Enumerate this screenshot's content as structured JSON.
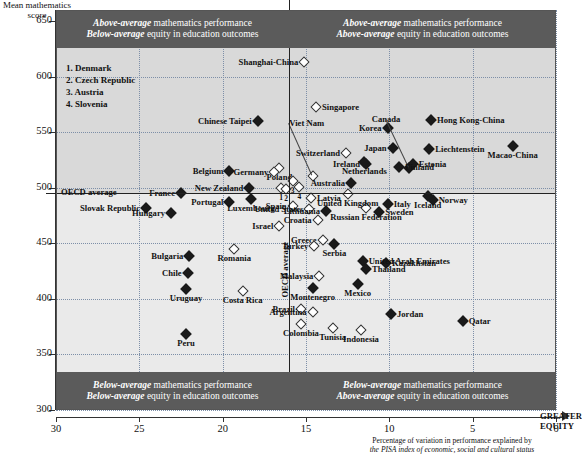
{
  "axes": {
    "y_title": "Mean mathematics score",
    "y_ticks": [
      650,
      600,
      550,
      500,
      450,
      400,
      350,
      300
    ],
    "x_ticks": [
      30,
      25,
      20,
      15,
      10,
      5,
      0
    ],
    "x_title_line1": "Percentage of variation in performance explained by",
    "x_title_line2_italic": "the PISA index of economic, social and cultural status",
    "greater_equity_line1": "GREATER",
    "greater_equity_line2": "EQUITY",
    "oecd_h_label": "OECD average",
    "oecd_v_label": "OECD average"
  },
  "quadrants": [
    {
      "id": "top-left",
      "line1_bold": "Above-average",
      "line1_rest": " mathematics performance",
      "line2_bold": "Below-average",
      "line2_rest": " equity in education outcomes"
    },
    {
      "id": "top-right",
      "line1_bold": "Above-average",
      "line1_rest": " mathematics performance",
      "line2_bold": "Above-average",
      "line2_rest": " equity in education outcomes"
    },
    {
      "id": "bottom-left",
      "line1_bold": "Below-average",
      "line1_rest": " mathematics performance",
      "line2_bold": "Below-average",
      "line2_rest": " equity in education outcomes"
    },
    {
      "id": "bottom-right",
      "line1_bold": "Below-average",
      "line1_rest": " mathematics performance",
      "line2_bold": "Above-average",
      "line2_rest": " equity in education outcomes"
    }
  ],
  "legend": {
    "items": [
      "1. Denmark",
      "2. Czech Republic",
      "3. Austria",
      "4. Slovenia"
    ]
  },
  "colors": {
    "quadrant_upper": "#d9d9d9",
    "quadrant_lower": "#eaeaea",
    "banner": "#5b5b5b",
    "banner_text": "#ffffff",
    "gridline": "#7d8fa8",
    "marker_filled": "#1a1a1a",
    "marker_open": "#ffffff"
  },
  "chart_data": {
    "type": "scatter",
    "title": "",
    "xlabel": "Percentage of variation in performance explained by the PISA index of economic, social and cultural status",
    "ylabel": "Mean mathematics score",
    "xlim": [
      30,
      0
    ],
    "x_reversed": true,
    "ylim": [
      300,
      660
    ],
    "grid": true,
    "oecd_average_x": 14.8,
    "oecd_average_y": 496,
    "marker_legend": {
      "filled": "OECD member / statistically significant",
      "open": "non-significant"
    },
    "points": [
      {
        "name": "Shanghai-China",
        "x": 15.1,
        "y": 613,
        "marker": "open",
        "label_pos": "r"
      },
      {
        "name": "Singapore",
        "x": 14.4,
        "y": 573,
        "marker": "open",
        "label_pos": "l"
      },
      {
        "name": "Chinese Taipei",
        "x": 17.9,
        "y": 560,
        "marker": "filled",
        "label_pos": "r"
      },
      {
        "name": "Viet Nam",
        "x": 14.6,
        "y": 511,
        "marker": "open",
        "label_pos": "l",
        "leader": true,
        "label_x": 16.0,
        "label_y": 558
      },
      {
        "name": "Korea",
        "x": 10.1,
        "y": 554,
        "marker": "filled",
        "label_pos": "r"
      },
      {
        "name": "Canada",
        "x": 8.8,
        "y": 518,
        "marker": "filled",
        "label_pos": "c",
        "leader": true,
        "label_x": 10.2,
        "label_y": 562
      },
      {
        "name": "Hong Kong-China",
        "x": 7.5,
        "y": 561,
        "marker": "filled",
        "label_pos": "l"
      },
      {
        "name": "Japan",
        "x": 9.8,
        "y": 536,
        "marker": "filled",
        "label_pos": "r"
      },
      {
        "name": "Switzerland",
        "x": 12.6,
        "y": 531,
        "marker": "open",
        "label_pos": "r"
      },
      {
        "name": "Liechtenstein",
        "x": 7.6,
        "y": 535,
        "marker": "filled",
        "label_pos": "l"
      },
      {
        "name": "Macao-China",
        "x": 2.6,
        "y": 538,
        "marker": "filled",
        "label_pos": "c"
      },
      {
        "name": "Ireland",
        "x": 11.4,
        "y": 521,
        "marker": "filled",
        "label_pos": "r"
      },
      {
        "name": "Estonia",
        "x": 8.6,
        "y": 521,
        "marker": "filled",
        "label_pos": "l"
      },
      {
        "name": "Netherlands",
        "x": 11.5,
        "y": 523,
        "marker": "filled",
        "label_pos": "c"
      },
      {
        "name": "Australia",
        "x": 12.3,
        "y": 504,
        "marker": "filled",
        "label_pos": "r"
      },
      {
        "name": "Finland",
        "x": 9.4,
        "y": 519,
        "marker": "filled",
        "label_pos": "l",
        "leader": true
      },
      {
        "name": "Poland",
        "x": 16.6,
        "y": 518,
        "marker": "open",
        "label_pos": "c"
      },
      {
        "name": "Belgium",
        "x": 19.6,
        "y": 515,
        "marker": "filled",
        "label_pos": "r"
      },
      {
        "name": "Germany",
        "x": 16.9,
        "y": 514,
        "marker": "open",
        "label_pos": "r"
      },
      {
        "name": "Denmark",
        "x": 16.5,
        "y": 500,
        "marker": "open",
        "number": 1
      },
      {
        "name": "Czech Republic",
        "x": 16.2,
        "y": 499,
        "marker": "open",
        "number": 2
      },
      {
        "name": "Austria",
        "x": 15.8,
        "y": 506,
        "marker": "open",
        "number": 3
      },
      {
        "name": "Slovenia",
        "x": 15.4,
        "y": 501,
        "marker": "open",
        "number": 4
      },
      {
        "name": "New Zealand",
        "x": 18.4,
        "y": 500,
        "marker": "filled",
        "label_pos": "r"
      },
      {
        "name": "France",
        "x": 22.5,
        "y": 495,
        "marker": "filled",
        "label_pos": "r"
      },
      {
        "name": "OECD average",
        "x": 14.8,
        "y": 494,
        "marker": "none"
      },
      {
        "name": "Portugal",
        "x": 19.6,
        "y": 487,
        "marker": "filled",
        "label_pos": "r"
      },
      {
        "name": "Spain",
        "x": 15.8,
        "y": 484,
        "marker": "open",
        "label_pos": "r"
      },
      {
        "name": "Latvia",
        "x": 14.7,
        "y": 491,
        "marker": "open",
        "label_pos": "l"
      },
      {
        "name": "Slovak Republic",
        "x": 24.6,
        "y": 482,
        "marker": "filled",
        "label_pos": "r"
      },
      {
        "name": "Hungary",
        "x": 23.1,
        "y": 477,
        "marker": "filled",
        "label_pos": "r",
        "leader": true
      },
      {
        "name": "Luxembourg",
        "x": 18.3,
        "y": 490,
        "marker": "filled",
        "label_pos": "c",
        "leader": true
      },
      {
        "name": "Israel",
        "x": 16.6,
        "y": 466,
        "marker": "open",
        "label_pos": "r"
      },
      {
        "name": "United States",
        "x": 14.8,
        "y": 481,
        "marker": "open",
        "label_pos": "r",
        "leader": true
      },
      {
        "name": "Greece",
        "x": 14.0,
        "y": 453,
        "marker": "open",
        "label_pos": "r"
      },
      {
        "name": "Italy",
        "x": 10.1,
        "y": 485,
        "marker": "filled",
        "label_pos": "l"
      },
      {
        "name": "Sweden",
        "x": 10.6,
        "y": 478,
        "marker": "filled",
        "label_pos": "l"
      },
      {
        "name": "Norway",
        "x": 7.4,
        "y": 489,
        "marker": "filled",
        "label_pos": "l"
      },
      {
        "name": "Iceland",
        "x": 7.7,
        "y": 493,
        "marker": "filled",
        "label_pos": "c"
      },
      {
        "name": "Lithuania",
        "x": 13.8,
        "y": 479,
        "marker": "filled",
        "label_pos": "r"
      },
      {
        "name": "Croatia",
        "x": 14.3,
        "y": 471,
        "marker": "open",
        "label_pos": "r"
      },
      {
        "name": "Russian Federation",
        "x": 11.4,
        "y": 482,
        "marker": "open",
        "label_pos": "c"
      },
      {
        "name": "United Kingdom",
        "x": 12.5,
        "y": 494,
        "marker": "open",
        "label_pos": "c",
        "leader": true
      },
      {
        "name": "Turkey",
        "x": 14.5,
        "y": 448,
        "marker": "open",
        "label_pos": "r"
      },
      {
        "name": "Serbia",
        "x": 13.3,
        "y": 449,
        "marker": "filled",
        "label_pos": "c"
      },
      {
        "name": "Malaysia",
        "x": 14.2,
        "y": 421,
        "marker": "open",
        "label_pos": "r"
      },
      {
        "name": "Kazakhstan",
        "x": 10.2,
        "y": 432,
        "marker": "filled",
        "label_pos": "l"
      },
      {
        "name": "United Arab Emirates",
        "x": 11.6,
        "y": 434,
        "marker": "filled",
        "label_pos": "l",
        "leader": true
      },
      {
        "name": "Thailand",
        "x": 11.4,
        "y": 427,
        "marker": "filled",
        "label_pos": "l",
        "leader": true
      },
      {
        "name": "Mexico",
        "x": 11.9,
        "y": 413,
        "marker": "filled",
        "label_pos": "c"
      },
      {
        "name": "Montenegro",
        "x": 14.6,
        "y": 410,
        "marker": "filled",
        "label_pos": "c"
      },
      {
        "name": "Bulgaria",
        "x": 22.0,
        "y": 439,
        "marker": "filled",
        "label_pos": "r"
      },
      {
        "name": "Romania",
        "x": 19.3,
        "y": 445,
        "marker": "open",
        "label_pos": "c"
      },
      {
        "name": "Chile",
        "x": 22.1,
        "y": 423,
        "marker": "filled",
        "label_pos": "r"
      },
      {
        "name": "Costa Rica",
        "x": 18.8,
        "y": 407,
        "marker": "open",
        "label_pos": "c"
      },
      {
        "name": "Uruguay",
        "x": 22.2,
        "y": 409,
        "marker": "filled",
        "label_pos": "c"
      },
      {
        "name": "Brazil",
        "x": 15.3,
        "y": 391,
        "marker": "open",
        "label_pos": "r"
      },
      {
        "name": "Argentina",
        "x": 14.6,
        "y": 388,
        "marker": "open",
        "label_pos": "r",
        "leader": true
      },
      {
        "name": "Colombia",
        "x": 15.3,
        "y": 377,
        "marker": "open",
        "label_pos": "c"
      },
      {
        "name": "Peru",
        "x": 22.2,
        "y": 368,
        "marker": "filled",
        "label_pos": "c"
      },
      {
        "name": "Tunisia",
        "x": 13.4,
        "y": 374,
        "marker": "open",
        "label_pos": "c"
      },
      {
        "name": "Indonesia",
        "x": 11.7,
        "y": 372,
        "marker": "open",
        "label_pos": "c"
      },
      {
        "name": "Jordan",
        "x": 9.9,
        "y": 386,
        "marker": "filled",
        "label_pos": "l"
      },
      {
        "name": "Qatar",
        "x": 5.6,
        "y": 380,
        "marker": "filled",
        "label_pos": "l"
      }
    ]
  }
}
